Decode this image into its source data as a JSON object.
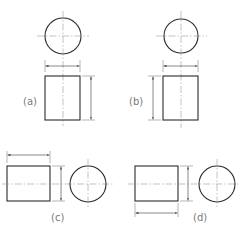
{
  "figure": {
    "colors": {
      "object_line": "#2a2a2a",
      "center_line": "#9a9a9a",
      "dimension_line": "#3a3a3a",
      "label": "#7a7a7a",
      "background": "#ffffff"
    },
    "views": [
      {
        "id": "a",
        "label": "(a)",
        "layout": "circle above rectangle",
        "diameter_dim": "horizontal above rectangle",
        "length_dim": "vertical right of rectangle"
      },
      {
        "id": "b",
        "label": "(b)",
        "layout": "circle above rectangle",
        "diameter_dim": "horizontal above rectangle",
        "length_dim": "vertical left of rectangle"
      },
      {
        "id": "c",
        "label": "(c)",
        "layout": "rectangle left of circle",
        "length_dim": "horizontal above rectangle",
        "diameter_dim": "vertical right of rectangle"
      },
      {
        "id": "d",
        "label": "(d)",
        "layout": "rectangle left of circle",
        "diameter_dim": "vertical right of rectangle",
        "length_dim": "horizontal below rectangle"
      }
    ]
  }
}
